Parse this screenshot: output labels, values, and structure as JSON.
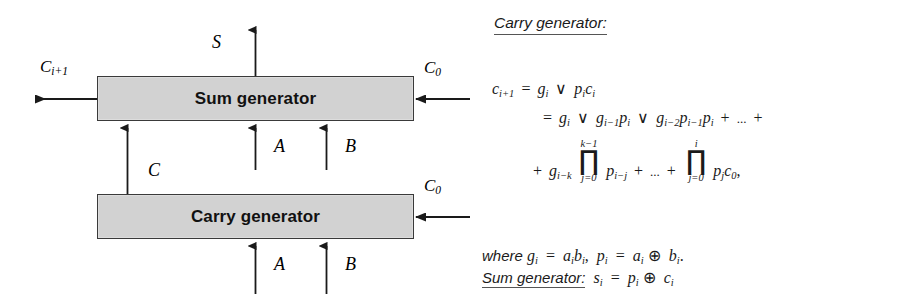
{
  "figure": {
    "type": "block-diagram-with-equations",
    "caption": ""
  },
  "diagram": {
    "blocks": [
      {
        "id": "sum",
        "label": "Sum generator"
      },
      {
        "id": "carry",
        "label": "Carry generator"
      }
    ],
    "signals": {
      "sum_output_top": "S",
      "carry_out_left": "C",
      "carry_out_left_sub": "i+1",
      "sum_carry_in_right": "C",
      "sum_carry_in_right_sub": "0",
      "carry_carry_in_right": "C",
      "carry_carry_in_right_sub": "0",
      "intermediate_carry": "C",
      "sum_input_a": "A",
      "sum_input_b": "B",
      "carry_input_a": "A",
      "carry_input_b": "B"
    },
    "colors": {
      "block_fill": "#d2d2d2",
      "block_border": "#3a3a3a",
      "line": "#1a1a1a"
    }
  },
  "math": {
    "heading_carry": "Carry generator:",
    "equations": {
      "line1": {
        "lhs": "c",
        "lhs_sub": "i+1",
        "eq": "=",
        "terms": "g_i ∨ p_i c_i"
      },
      "line2": {
        "eq": "=",
        "terms": "g_i ∨ g_{i-1} p_i ∨ g_{i-2} p_{i-1} p_i + ... +"
      },
      "line3": {
        "terms": "+ g_{i-k} ∏_{j=0}^{k-1} p_{i-j} + ... + ∏_{j=0}^{i} p_j c_0,"
      },
      "prod1": {
        "upper": "k−1",
        "lower": "j=0"
      },
      "prod2": {
        "upper": "i",
        "lower": "j=0"
      }
    },
    "where_line": {
      "prefix": "where",
      "body": "g_i = a_i b_i,  p_i = a_i ⊕ b_i."
    },
    "sum_line": {
      "label": "Sum generator:",
      "body": "s_i = p_i ⊕ c_i"
    },
    "symbols": {
      "or": "∨",
      "xor": "⊕",
      "plus": "+",
      "ellipsis": "...",
      "product": "∏",
      "equals": "="
    }
  }
}
